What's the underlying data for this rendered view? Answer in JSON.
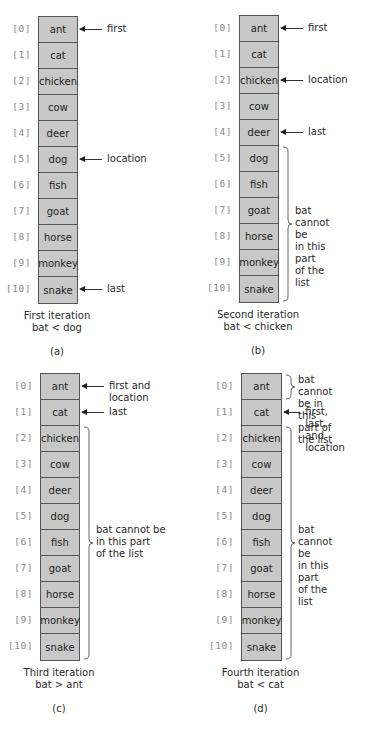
{
  "array": {
    "indices": [
      "[0]",
      "[1]",
      "[2]",
      "[3]",
      "[4]",
      "[5]",
      "[6]",
      "[7]",
      "[8]",
      "[9]",
      "[10]"
    ],
    "values": [
      "ant",
      "cat",
      "chicken",
      "cow",
      "deer",
      "dog",
      "fish",
      "goat",
      "horse",
      "monkey",
      "snake"
    ]
  },
  "panels": [
    {
      "label": "(a)",
      "caption_line1": "First iteration",
      "caption_line2": "bat < dog",
      "pointers": [
        {
          "row": 0,
          "text": "first"
        },
        {
          "row": 5,
          "text": "location"
        },
        {
          "row": 10,
          "text": "last"
        }
      ],
      "braces": []
    },
    {
      "label": "(b)",
      "caption_line1": "Second iteration",
      "caption_line2": "bat < chicken",
      "pointers": [
        {
          "row": 0,
          "text": "first"
        },
        {
          "row": 2,
          "text": "location"
        },
        {
          "row": 4,
          "text": "last"
        }
      ],
      "braces": [
        {
          "from": 5,
          "to": 10,
          "text": "bat cannot be\nin this part\nof the list"
        }
      ]
    },
    {
      "label": "(c)",
      "caption_line1": "Third iteration",
      "caption_line2": "bat > ant",
      "pointers": [
        {
          "row": 0,
          "text": "first and location"
        },
        {
          "row": 1,
          "text": "last"
        }
      ],
      "braces": [
        {
          "from": 2,
          "to": 10,
          "text": "bat cannot be\nin this part\nof the list"
        }
      ]
    },
    {
      "label": "(d)",
      "caption_line1": "Fourth iteration",
      "caption_line2": "bat < cat",
      "pointers": [
        {
          "row": 1,
          "text": "first, last,\nand location"
        }
      ],
      "braces": [
        {
          "from": 0,
          "to": 0,
          "text": "bat cannot be in\nthis part of the list"
        },
        {
          "from": 2,
          "to": 10,
          "text": "bat cannot be\nin this part\nof the list"
        }
      ]
    }
  ],
  "colors": {
    "cell_fill": "#c8c8c8",
    "cell_border": "#555555",
    "index_text": "#8a8a8a",
    "text": "#2a2a2a"
  }
}
